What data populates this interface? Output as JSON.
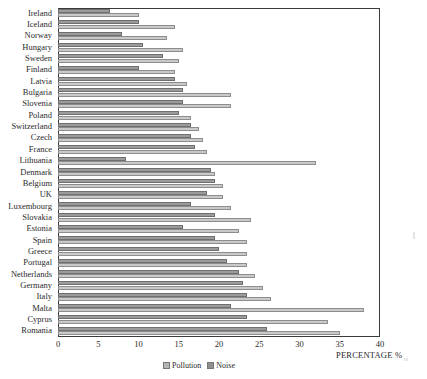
{
  "chart_data": {
    "type": "bar",
    "orientation": "horizontal",
    "title": "",
    "subtitle": "",
    "xlabel": "PERCENTAGE %",
    "ylabel": "",
    "xlim": [
      0,
      40
    ],
    "xticks": [
      0,
      5,
      10,
      15,
      20,
      25,
      30,
      35,
      40
    ],
    "grid": false,
    "legend_position": "bottom",
    "categories": [
      "Ireland",
      "Iceland",
      "Norway",
      "Hungary",
      "Sweden",
      "Finland",
      "Latvia",
      "Bulgaria",
      "Slovenia",
      "Poland",
      "Switzerland",
      "Czech",
      "France",
      "Lithuania",
      "Denmark",
      "Belgium",
      "UK",
      "Luxembourg",
      "Slovakia",
      "Estonia",
      "Spain",
      "Greece",
      "Portugal",
      "Netherlands",
      "Germany",
      "Italy",
      "Malta",
      "Cyprus",
      "Romania"
    ],
    "series": [
      {
        "name": "Pollution",
        "color": "#9b9b9b",
        "values": [
          6.5,
          10.0,
          8.0,
          10.5,
          13.0,
          10.0,
          14.5,
          15.5,
          15.5,
          15.0,
          16.5,
          16.5,
          17.0,
          8.5,
          19.0,
          19.5,
          18.5,
          16.5,
          19.5,
          15.5,
          19.5,
          20.0,
          21.0,
          22.5,
          23.0,
          23.5,
          21.5,
          23.5,
          26.0
        ]
      },
      {
        "name": "Noise",
        "color": "#c9c9c9",
        "values": [
          10.0,
          14.5,
          13.5,
          15.5,
          15.0,
          14.5,
          16.0,
          21.5,
          21.5,
          16.5,
          17.5,
          18.0,
          18.5,
          32.0,
          19.5,
          20.5,
          20.5,
          21.5,
          24.0,
          22.5,
          23.5,
          23.5,
          23.5,
          24.5,
          25.5,
          26.5,
          38.0,
          33.5,
          35.0
        ]
      }
    ]
  },
  "legend": {
    "items": [
      {
        "label": "Pollution"
      },
      {
        "label": "Noise"
      }
    ]
  }
}
